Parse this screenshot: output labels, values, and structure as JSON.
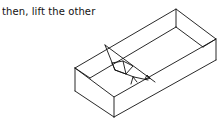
{
  "caption": "then, lift the other",
  "diagram": {
    "stroke_color": "#111111",
    "background": "#ffffff"
  }
}
